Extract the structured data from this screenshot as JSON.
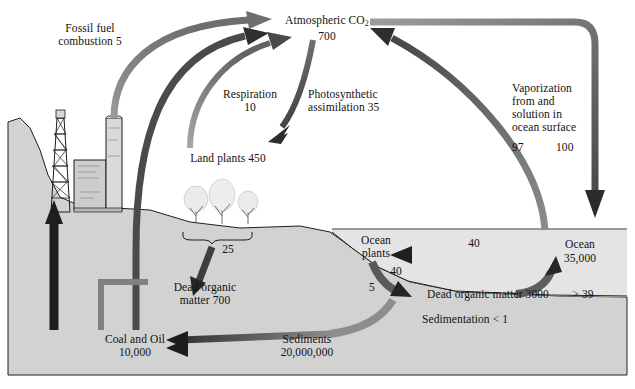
{
  "diagram": {
    "type": "flow-diagram",
    "units_note": "reservoirs and fluxes in gigatons of carbon"
  },
  "palette": {
    "background": "#ffffff",
    "land": "#d2d2d2",
    "land_dark": "#c4c4c4",
    "ocean": "#e2e2e2",
    "seafloor": "#d0d0d0",
    "arrow_dark": "#3a3a3a",
    "arrow_mid": "#6b6b6b",
    "arrow_light": "#9a9a9a",
    "text": "#141414",
    "outline": "#1a1a1a"
  },
  "reservoirs": [
    {
      "id": "atmosphere",
      "name": "Atmospheric CO",
      "sub": "2",
      "value": "700",
      "label": "Atmospheric CO₂ 700"
    },
    {
      "id": "land-plants",
      "name": "Land plants",
      "value": "450",
      "label": "Land plants 450"
    },
    {
      "id": "dead-organic-land",
      "name": "Dead organic matter",
      "value": "700",
      "label": "Dead organic matter 700"
    },
    {
      "id": "coal-oil",
      "name": "Coal and Oil",
      "value": "10,000",
      "label": "Coal and Oil 10,000"
    },
    {
      "id": "sediments",
      "name": "Sediments",
      "value": "20,000,000",
      "label": "Sediments 20,000,000"
    },
    {
      "id": "ocean",
      "name": "Ocean",
      "value": "35,000",
      "label": "Ocean 35,000"
    },
    {
      "id": "ocean-plants",
      "name": "Ocean plants",
      "value": "",
      "label": "Ocean plants"
    },
    {
      "id": "dead-organic-ocean",
      "name": "Dead organic matter",
      "value": "3000",
      "label": "Dead organic matter 3000"
    }
  ],
  "labels": {
    "atmosphere_name": "Atmospheric CO",
    "atmosphere_sub": "2",
    "atmosphere_value": "700",
    "fossil_fuel": "Fossil fuel\ncombustion 5",
    "respiration": "Respiration\n10",
    "photosynthetic": "Photosynthetic\nassimilation 35",
    "vaporization": "Vaporization\nfrom and\nsolution in\nocean surface",
    "vaporization_v1": "97",
    "vaporization_v2": "100",
    "land_plants": "Land plants 450",
    "litterfall_value": "25",
    "dead_organic_land": "Dead organic\nmatter 700",
    "coal_oil": "Coal and Oil\n10,000",
    "sediments": "Sediments\n20,000,000",
    "sedimentation": "Sedimentation < 1",
    "ocean_plants": "Ocean\nplants",
    "ocean_uptake_value": "40",
    "ocean_plants_to_dead": "40",
    "ocean_plants_five": "5",
    "dead_organic_ocean": "Dead organic matter 3000",
    "remineralization": "> 39",
    "ocean_name": "Ocean",
    "ocean_value": "35,000"
  },
  "fluxes": [
    {
      "id": "fossil-fuel-combustion",
      "from": "coal-oil",
      "to": "atmosphere",
      "value": "5",
      "label": "Fossil fuel combustion 5"
    },
    {
      "id": "respiration",
      "from": "land-plants",
      "to": "atmosphere",
      "value": "10",
      "label": "Respiration 10"
    },
    {
      "id": "photosynthetic-assimilation",
      "from": "atmosphere",
      "to": "land-plants",
      "value": "35",
      "label": "Photosynthetic assimilation 35"
    },
    {
      "id": "soil-respiration",
      "from": "dead-organic-land",
      "to": "atmosphere",
      "value": "",
      "label": "Soil respiration"
    },
    {
      "id": "litterfall",
      "from": "land-plants",
      "to": "dead-organic-land",
      "value": "25",
      "label": "25"
    },
    {
      "id": "vaporization-out",
      "from": "ocean",
      "to": "atmosphere",
      "value": "97",
      "label": "Vaporization from ocean surface 97"
    },
    {
      "id": "solution-in",
      "from": "atmosphere",
      "to": "ocean",
      "value": "100",
      "label": "Solution in ocean surface 100"
    },
    {
      "id": "ocean-uptake",
      "from": "ocean",
      "to": "ocean-plants",
      "value": "40",
      "label": "40"
    },
    {
      "id": "ocean-plants-to-dead",
      "from": "ocean-plants",
      "to": "dead-organic-ocean",
      "value": "40",
      "label": "40"
    },
    {
      "id": "ocean-plants-five",
      "from": "ocean-plants",
      "to": "dead-organic-ocean",
      "value": "5",
      "label": "5"
    },
    {
      "id": "remineralization",
      "from": "dead-organic-ocean",
      "to": "ocean",
      "value": "> 39",
      "label": "> 39"
    },
    {
      "id": "sedimentation",
      "from": "dead-organic-ocean",
      "to": "sediments",
      "value": "< 1",
      "label": "Sedimentation < 1"
    },
    {
      "id": "sediments-to-coal-oil",
      "from": "sediments",
      "to": "coal-oil",
      "value": "",
      "label": "Sediments to Coal and Oil"
    },
    {
      "id": "extraction",
      "from": "coal-oil",
      "to": "rig",
      "value": "",
      "label": "Extraction"
    }
  ],
  "scene": {
    "oil_rig": "oil-derrick",
    "factory": "factory-with-smokestack",
    "trees": [
      "tree",
      "tree",
      "tree"
    ],
    "brace": "tree-brace"
  }
}
